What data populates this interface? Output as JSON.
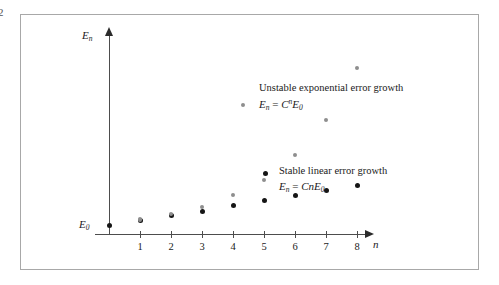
{
  "corner_mark": "2",
  "figure": {
    "axes": {
      "y_label": "E",
      "y_label_sub": "n",
      "x_label": "n",
      "origin_label": "E",
      "origin_label_sub": "0"
    }
  },
  "legend": {
    "unstable": {
      "title": "Unstable exponential error growth",
      "formula_lhs": "E",
      "formula_lhs_sub": "n",
      "formula_op": " = ",
      "formula_rhs_base": "C",
      "formula_rhs_exp": "n",
      "formula_rhs_tail": "E",
      "formula_rhs_tail_sub": "0",
      "marker_color": "#8e8e8e"
    },
    "stable": {
      "title": "Stable linear error growth",
      "formula_lhs": "E",
      "formula_lhs_sub": "n",
      "formula_op": " = ",
      "formula_rhs_base": "Cn",
      "formula_rhs_tail": "E",
      "formula_rhs_tail_sub": "0",
      "marker_color": "#151515"
    }
  },
  "chart_data": {
    "type": "scatter",
    "title": "",
    "xlabel": "n",
    "ylabel": "E_n",
    "grid": false,
    "legend_position": "inside-right",
    "xlim": [
      0,
      9
    ],
    "ylim": [
      0,
      10
    ],
    "xticks": [
      1,
      2,
      3,
      4,
      5,
      6,
      7,
      8
    ],
    "xticklabels": [
      "1",
      "2",
      "3",
      "4",
      "5",
      "6",
      "7",
      "8"
    ],
    "yticks": [],
    "yticklabels": [],
    "annotations": [
      {
        "text": "E_0",
        "x": 0,
        "y": 0.45,
        "note": "y-axis origin error level label"
      }
    ],
    "series": [
      {
        "name": "Stable linear error growth",
        "formula": "E_n = CnE_0",
        "color": "#151515",
        "marker": "filled-circle",
        "x": [
          0,
          1,
          2,
          3,
          4,
          5,
          6,
          7,
          8
        ],
        "y": [
          0.45,
          0.7,
          0.95,
          1.15,
          1.45,
          1.7,
          1.95,
          2.2,
          2.45
        ]
      },
      {
        "name": "Unstable exponential error growth",
        "formula": "E_n = C^n E_0",
        "color": "#8e8e8e",
        "marker": "filled-circle",
        "x": [
          1,
          2,
          3,
          4,
          5,
          6,
          7,
          8
        ],
        "y": [
          0.72,
          1.0,
          1.35,
          1.95,
          2.7,
          3.95,
          5.7,
          8.3
        ]
      }
    ]
  }
}
